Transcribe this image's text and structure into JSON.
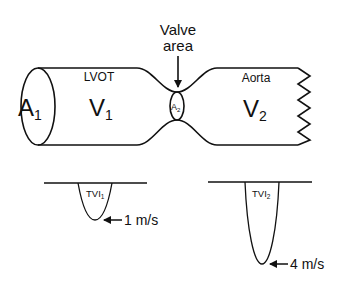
{
  "valve_label": {
    "line1": "Valve",
    "line2": "area"
  },
  "lvot": {
    "region_label": "LVOT",
    "area_symbol": "A",
    "area_subscript": "1",
    "velocity_symbol": "V",
    "velocity_subscript": "1"
  },
  "valve": {
    "area_symbol": "A",
    "area_subscript": "2"
  },
  "aorta": {
    "region_label": "Aorta",
    "velocity_symbol": "V",
    "velocity_subscript": "2"
  },
  "doppler": [
    {
      "label": "TVI",
      "subscript": "1",
      "peak_velocity": "1 m/s"
    },
    {
      "label": "TVI",
      "subscript": "2",
      "peak_velocity": "4 m/s"
    }
  ],
  "colors": {
    "stroke": "#111111",
    "background": "#ffffff"
  }
}
